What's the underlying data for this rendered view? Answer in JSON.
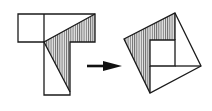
{
  "diagram": {
    "title": "T-shape dissection rearranged into a tilted square",
    "colors": {
      "stroke": "#1a1a1a",
      "hatch": "#555555",
      "hatch_bg": "#e8e8e8",
      "background": "#ffffff"
    },
    "left_figure": {
      "name": "T-shape",
      "outline": [
        [
          18,
          14
        ],
        [
          95,
          14
        ],
        [
          95,
          42
        ],
        [
          70,
          42
        ],
        [
          70,
          95
        ],
        [
          44,
          95
        ],
        [
          44,
          42
        ],
        [
          18,
          42
        ]
      ],
      "divider": [
        [
          44,
          14
        ],
        [
          44,
          42
        ]
      ],
      "hatched_region": [
        [
          44,
          42
        ],
        [
          95,
          14
        ],
        [
          95,
          42
        ],
        [
          70,
          42
        ],
        [
          70,
          92
        ]
      ]
    },
    "arrow": {
      "from": [
        87,
        66
      ],
      "to": [
        122,
        66
      ],
      "direction": "right"
    },
    "right_figure": {
      "name": "tilted-square",
      "outline": [
        [
          175,
          13
        ],
        [
          201,
          66
        ],
        [
          150,
          93
        ],
        [
          124,
          39
        ]
      ],
      "inner_square": [
        [
          150,
          40
        ],
        [
          175,
          40
        ],
        [
          175,
          66
        ],
        [
          150,
          66
        ]
      ],
      "lines": [
        [
          [
            175,
            13
          ],
          [
            175,
            40
          ]
        ],
        [
          [
            175,
            66
          ],
          [
            201,
            66
          ]
        ],
        [
          [
            150,
            66
          ],
          [
            150,
            93
          ]
        ]
      ],
      "hatched_region": [
        [
          124,
          39
        ],
        [
          175,
          13
        ],
        [
          175,
          40
        ],
        [
          150,
          40
        ],
        [
          150,
          93
        ]
      ]
    }
  }
}
